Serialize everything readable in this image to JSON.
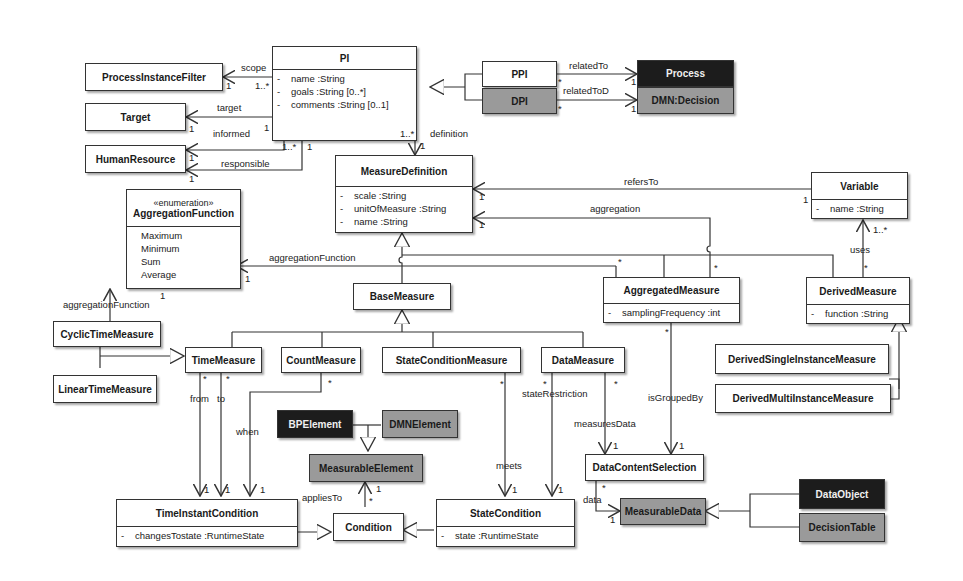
{
  "classes": {
    "pi": {
      "name": "PI",
      "attributes": [
        {
          "visibility": "-",
          "text": "name :String"
        },
        {
          "visibility": "-",
          "text": "goals :String [0..*]"
        },
        {
          "visibility": "-",
          "text": "comments :String [0..1]"
        }
      ]
    },
    "ppi": {
      "name": "PPI"
    },
    "dpi": {
      "name": "DPI"
    },
    "process": {
      "name": "Process"
    },
    "dmn_decision": {
      "name": "DMN:Decision"
    },
    "process_instance_filter": {
      "name": "ProcessInstanceFilter"
    },
    "target": {
      "name": "Target"
    },
    "human_resource": {
      "name": "HumanResource"
    },
    "measure_definition": {
      "name": "MeasureDefinition",
      "attributes": [
        {
          "visibility": "-",
          "text": "scale :String"
        },
        {
          "visibility": "-",
          "text": "unitOfMeasure :String"
        },
        {
          "visibility": "-",
          "text": "name :String"
        }
      ]
    },
    "aggregation_function": {
      "stereotype": "«enumeration»",
      "name": "AggregationFunction",
      "literals": [
        "Maximum",
        "Minimum",
        "Sum",
        "Average"
      ]
    },
    "variable": {
      "name": "Variable",
      "attributes": [
        {
          "visibility": "-",
          "text": "name :String"
        }
      ]
    },
    "base_measure": {
      "name": "BaseMeasure"
    },
    "aggregated_measure": {
      "name": "AggregatedMeasure",
      "attributes": [
        {
          "visibility": "-",
          "text": "samplingFrequency :int"
        }
      ]
    },
    "derived_measure": {
      "name": "DerivedMeasure",
      "attributes": [
        {
          "visibility": "-",
          "text": "function :String"
        }
      ]
    },
    "cyclic_time_measure": {
      "name": "CyclicTimeMeasure"
    },
    "linear_time_measure": {
      "name": "LinearTimeMeasure"
    },
    "time_measure": {
      "name": "TimeMeasure"
    },
    "count_measure": {
      "name": "CountMeasure"
    },
    "state_condition_measure": {
      "name": "StateConditionMeasure"
    },
    "data_measure": {
      "name": "DataMeasure"
    },
    "derived_single_instance_measure": {
      "name": "DerivedSingleInstanceMeasure"
    },
    "derived_multi_instance_measure": {
      "name": "DerivedMultiInstanceMeasure"
    },
    "bp_element": {
      "name": "BPElement"
    },
    "dmn_element": {
      "name": "DMNElement"
    },
    "measurable_element": {
      "name": "MeasurableElement"
    },
    "data_content_selection": {
      "name": "DataContentSelection"
    },
    "time_instant_condition": {
      "name": "TimeInstantCondition",
      "attributes": [
        {
          "visibility": "-",
          "text": "changesTostate :RuntimeState"
        }
      ]
    },
    "condition": {
      "name": "Condition"
    },
    "state_condition": {
      "name": "StateCondition",
      "attributes": [
        {
          "visibility": "-",
          "text": "state :RuntimeState"
        }
      ]
    },
    "measurable_data": {
      "name": "MeasurableData"
    },
    "data_object": {
      "name": "DataObject"
    },
    "decision_table": {
      "name": "DecisionTable"
    }
  },
  "labels": {
    "scope": "scope",
    "scope_m1": "1",
    "scope_m2": "1..*",
    "target": "target",
    "target_m1": "1",
    "target_m2": "1",
    "informed": "informed",
    "informed_m1": "1",
    "informed_m2": "1..*",
    "responsible": "responsible",
    "responsible_m1": "1",
    "responsible_m2": "1",
    "definition": "definition",
    "definition_m1": "1..*",
    "definition_m2": "1",
    "related_to": "relatedTo",
    "related_to_m1": "*",
    "related_to_m2": "1",
    "related_to_d": "relatedToD",
    "related_to_d_m1": "*",
    "related_to_d_m2": "1",
    "refers_to": "refersTo",
    "refers_to_m1": "1",
    "refers_to_m2": "1",
    "aggregation": "aggregation",
    "aggregation_m1": "1",
    "aggregation_m2": "*",
    "aggregation_function": "aggregationFunction",
    "aggregation_function_m1": "1",
    "aggregation_function_m2": "*",
    "cyclic_aggregation_function": "aggregationFunction",
    "cyclic_aggregation_function_m1": "1",
    "uses": "uses",
    "uses_m1": "1..*",
    "uses_m2": "*",
    "from": "from",
    "from_m1": "*",
    "from_m2": "1",
    "to": "to",
    "to_m1": "*",
    "to_m2": "1",
    "when": "when",
    "when_m1": "*",
    "when_m2": "1",
    "meets": "meets",
    "meets_m1": "*",
    "meets_m2": "1",
    "state_restriction": "stateRestriction",
    "state_restriction_m1": "*",
    "state_restriction_m2": "1",
    "measures_data": "measuresData",
    "measures_data_m1": "*",
    "measures_data_m2": "1",
    "is_grouped_by": "isGroupedBy",
    "is_grouped_by_m1": "*",
    "is_grouped_by_m2": "1",
    "applies_to": "appliesTo",
    "applies_to_m1": "*",
    "applies_to_m2": "1",
    "data": "data",
    "data_m1": "*",
    "data_m2": "1"
  },
  "colors": {
    "dark_fill": "#1c1c1c",
    "gray_fill": "#9a9a9a",
    "line": "#333333"
  }
}
